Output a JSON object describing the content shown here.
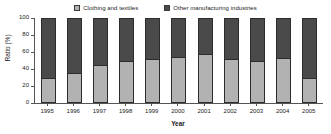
{
  "chart_data": {
    "type": "bar",
    "subtype": "stacked-100-percent",
    "title": "",
    "xlabel": "Year",
    "ylabel": "Ratio (%)",
    "ylim": [
      0,
      100
    ],
    "yticks": [
      0,
      20,
      40,
      60,
      80,
      100
    ],
    "ytick_labels": [
      "0",
      "20",
      "40",
      "60",
      "80",
      "100"
    ],
    "grid": false,
    "legend_position": "top-center",
    "categories": [
      "1995",
      "1996",
      "1997",
      "1998",
      "1999",
      "2000",
      "2001",
      "2002",
      "2003",
      "2004",
      "2005"
    ],
    "series": [
      {
        "name": "Clothing and textiles",
        "color": "#b2b2b2",
        "values": [
          30,
          35,
          45,
          50,
          52,
          54,
          58,
          52,
          50,
          53,
          30
        ]
      },
      {
        "name": "Other manufacturing industries",
        "color": "#4a4a4a",
        "values": [
          70,
          65,
          55,
          50,
          48,
          46,
          42,
          48,
          50,
          47,
          70
        ]
      }
    ]
  },
  "legend": {
    "entries": [
      {
        "label": "Clothing and textiles",
        "color": "#b2b2b2"
      },
      {
        "label": "Other manufacturing industries",
        "color": "#4a4a4a"
      }
    ]
  },
  "axes": {
    "y_title": "Ratio (%)",
    "x_title": "Year",
    "y_tick_labels": [
      "100",
      "80",
      "60",
      "40",
      "20",
      "0"
    ],
    "x_tick_labels": [
      "1995",
      "1996",
      "1997",
      "1998",
      "1999",
      "2000",
      "2001",
      "2002",
      "2003",
      "2004",
      "2005"
    ]
  }
}
